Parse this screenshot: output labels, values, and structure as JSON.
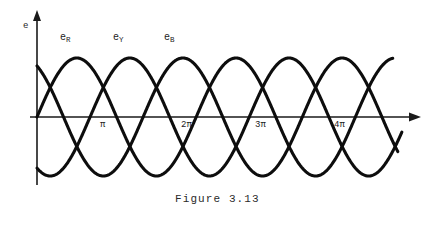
{
  "figure": {
    "caption": "Figure  3.13",
    "y_axis_label": "e",
    "background_color": "#ffffff",
    "curve_color": "#0d0d0d",
    "axis_color": "#1a1a1a"
  },
  "series_labels": [
    {
      "base": "e",
      "sub": "R",
      "name": "e_R"
    },
    {
      "base": "e",
      "sub": "Y",
      "name": "e_Y"
    },
    {
      "base": "e",
      "sub": "B",
      "name": "e_B"
    }
  ],
  "ticks": [
    {
      "label": "π"
    },
    {
      "label": "2π"
    },
    {
      "label": "3π"
    },
    {
      "label": "4π"
    }
  ],
  "chart_data": {
    "type": "line",
    "title": "Figure  3.13",
    "xlabel": "",
    "ylabel": "e",
    "grid": false,
    "legend": "inline-labels",
    "x_tick_labels": [
      "π",
      "2π",
      "3π",
      "4π"
    ],
    "x_tick_values": [
      3.1416,
      6.2832,
      9.4248,
      12.5664
    ],
    "xlim": [
      0,
      14.4
    ],
    "ylim": [
      -1.15,
      1.15
    ],
    "amplitude": 1,
    "period_radians": 6.2832,
    "phase_offsets_degrees": [
      0,
      -120,
      -240
    ],
    "series": [
      {
        "name": "e_R",
        "phase_deg": 0,
        "color": "#0d0d0d",
        "x_start": 0,
        "x_end": 14.05,
        "peaks_x": [
          1.5708,
          7.854,
          14.137
        ],
        "zeros_x": [
          0,
          3.1416,
          6.2832,
          9.4248,
          12.5664
        ]
      },
      {
        "name": "e_Y",
        "phase_deg": -120,
        "color": "#0d0d0d",
        "x_start": 0,
        "x_end": 14.4,
        "peaks_x": [
          3.665,
          9.948
        ],
        "zeros_x": [
          2.0944,
          5.236,
          8.3776,
          11.519,
          14.66
        ]
      },
      {
        "name": "e_B",
        "phase_deg": -240,
        "color": "#0d0d0d",
        "x_start": 0,
        "x_end": 14.25,
        "peaks_x": [
          5.7596,
          12.043
        ],
        "zeros_x": [
          4.18879,
          7.3304,
          10.472,
          13.614
        ]
      }
    ]
  }
}
